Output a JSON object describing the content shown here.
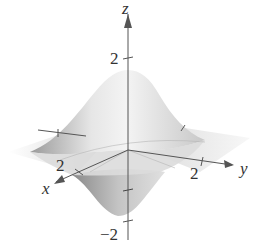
{
  "figure": {
    "type": "3d-surface",
    "surface_color": "#d9d9d9",
    "axis_color": "#555555"
  },
  "axes": {
    "z": {
      "name": "z",
      "ticks": [
        {
          "value": 2,
          "label": "2"
        },
        {
          "value": -2,
          "label": "−2"
        }
      ]
    },
    "x": {
      "name": "x",
      "ticks": [
        {
          "value": 2,
          "label": "2"
        }
      ]
    },
    "y": {
      "name": "y",
      "ticks": [
        {
          "value": 2,
          "label": "2"
        }
      ]
    }
  }
}
